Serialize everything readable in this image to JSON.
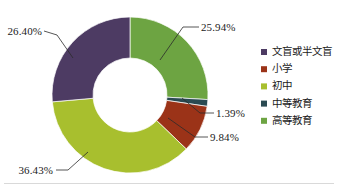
{
  "chart_data": {
    "type": "pie",
    "variant": "donut",
    "title": "",
    "xlabel": "",
    "ylabel": "",
    "legend_position": "right",
    "grid": false,
    "start_angle_deg": 0,
    "direction": "clockwise",
    "categories": [
      "文盲或半文盲",
      "小学",
      "初中",
      "中等教育",
      "高等教育"
    ],
    "values": [
      26.4,
      9.84,
      36.43,
      1.39,
      25.94
    ],
    "value_labels": [
      "26.40%",
      "9.84%",
      "36.43%",
      "1.39%",
      "25.94%"
    ],
    "colors": [
      "#4D3B63",
      "#9B3318",
      "#A8BF2E",
      "#2A4A52",
      "#6DA442"
    ],
    "draw_order_clockwise": [
      {
        "category": "高等教育",
        "value": 25.94,
        "label": "25.94%",
        "color": "#6DA442"
      },
      {
        "category": "中等教育",
        "value": 1.39,
        "label": "1.39%",
        "color": "#2A4A52"
      },
      {
        "category": "小学",
        "value": 9.84,
        "label": "9.84%",
        "color": "#9B3318"
      },
      {
        "category": "初中",
        "value": 36.43,
        "label": "36.43%",
        "color": "#A8BF2E"
      },
      {
        "category": "文盲或半文盲",
        "value": 26.4,
        "label": "26.40%",
        "color": "#4D3B63"
      }
    ]
  },
  "labels": {
    "higher_education_pct": "25.94%",
    "secondary_education_pct": "1.39%",
    "primary_school_pct": "9.84%",
    "junior_high_pct": "36.43%",
    "illiterate_pct": "26.40%"
  },
  "legend": {
    "items": [
      {
        "label": "文盲或半文盲",
        "color": "#4D3B63"
      },
      {
        "label": "小学",
        "color": "#9B3318"
      },
      {
        "label": "初中",
        "color": "#A8BF2E"
      },
      {
        "label": "中等教育",
        "color": "#2A4A52"
      },
      {
        "label": "高等教育",
        "color": "#6DA442"
      }
    ]
  }
}
